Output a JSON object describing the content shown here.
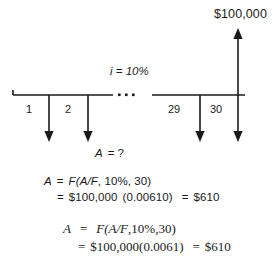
{
  "diagram": {
    "type": "cash-flow-diagram",
    "title_amount": "$100,000",
    "interest_rate_label": "i = 10%",
    "unknown_label_symbol": "A",
    "unknown_label_value": "= ?",
    "ellipsis": "· · ·",
    "periods_left": [
      "1",
      "2"
    ],
    "periods_right": [
      "29",
      "30"
    ],
    "inflow": {
      "label": "$100,000",
      "direction": "up",
      "period": "30"
    },
    "outflows": {
      "direction": "down",
      "label": "A",
      "count": 30
    },
    "colors": {
      "line": "#1a1a1a",
      "background": "#ffffff",
      "text": "#1a1a1a"
    }
  },
  "equations": {
    "first": {
      "line1": {
        "lhs": "A",
        "eq": "=",
        "fn": "F(A/F",
        "rate": ", 10%",
        "periods": ", 30)"
      },
      "line2": {
        "eq": "=",
        "principal": "$100,000",
        "factor": "(0.00610)",
        "eq2": "=",
        "result": "$610"
      }
    },
    "second": {
      "line1": {
        "lhs": "A",
        "eq": "=",
        "fn": "F(A/F",
        "rate": ",10%",
        "periods": ",30)"
      },
      "line2": {
        "eq": "=",
        "principal": "$100,000",
        "factor": "(0.0061)",
        "eq2": "=",
        "result": "$610"
      }
    }
  }
}
